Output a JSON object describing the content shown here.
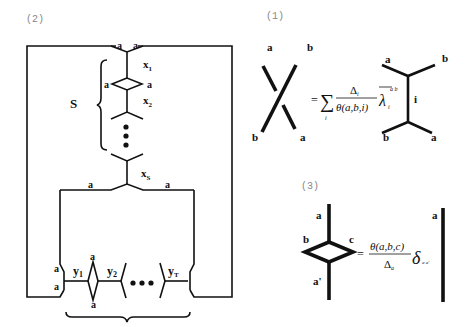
{
  "panels": {
    "p2": {
      "caption": "(2)",
      "labels": {
        "a_top_left": "a",
        "a_top_right": "a",
        "x1": "x",
        "x1_sub": "1",
        "a_diamond_left": "a",
        "a_diamond_right": "a",
        "x2": "x",
        "x2_sub": "2",
        "S": "S",
        "xs": "x",
        "xs_sub": "S",
        "a_mid_left": "a",
        "a_mid_right": "a",
        "a_bot_left_upper": "a",
        "a_bot_left_lower": "a",
        "y1": "y",
        "y1_sub": "1",
        "a_bdiamond_top": "a",
        "a_bdiamond_bottom": "a",
        "y2": "y",
        "y2_sub": "2",
        "yT": "y",
        "yT_sub": "T"
      }
    },
    "p1": {
      "caption": "(1)",
      "labels": {
        "cross_a_top": "a",
        "cross_b_top": "b",
        "cross_b_bottom": "b",
        "cross_a_bottom": "a",
        "equals": "=",
        "sum": "∑",
        "sum_index": "i",
        "numerator": "Δ",
        "numerator_sub": "i",
        "denominator": "θ(a,b,i)",
        "lambda": "λ",
        "lambda_sub": "i",
        "lambda_sup": "a b",
        "tree_a_top": "a",
        "tree_b_top": "b",
        "tree_i": "i",
        "tree_b_bottom": "b",
        "tree_a_bottom": "a"
      }
    },
    "p3": {
      "caption": "(3)",
      "labels": {
        "a_top": "a",
        "b": "b",
        "c": "c",
        "a_prime": "a'",
        "equals": "=",
        "numerator": "θ(a,b,c)",
        "denominator": "Δ",
        "denominator_sub": "a",
        "delta": "δ",
        "delta_sub": "a a'",
        "a_right": "a"
      }
    }
  }
}
